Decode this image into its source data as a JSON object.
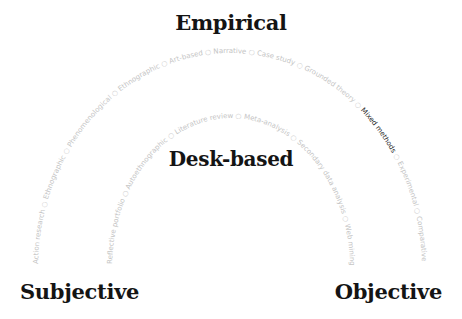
{
  "axes": {
    "top": "Empirical",
    "middle": "Desk-based",
    "left": "Subjective",
    "right": "Objective"
  },
  "separator": "○",
  "outer_arc": {
    "label": "Empirical methods",
    "items": [
      {
        "label": "Action research",
        "highlighted": false
      },
      {
        "label": "Ethnographic",
        "highlighted": false
      },
      {
        "label": "Phenomenological",
        "highlighted": false
      },
      {
        "label": "Ethnographic",
        "highlighted": false
      },
      {
        "label": "Art-based",
        "highlighted": false
      },
      {
        "label": "Narrative",
        "highlighted": false
      },
      {
        "label": "Case study",
        "highlighted": false
      },
      {
        "label": "Grounded theory",
        "highlighted": false
      },
      {
        "label": "Mixed methods",
        "highlighted": true
      },
      {
        "label": "Experimental",
        "highlighted": false
      },
      {
        "label": "Comparative",
        "highlighted": false
      }
    ]
  },
  "inner_arc": {
    "label": "Desk-based methods",
    "items": [
      {
        "label": "Reflective portfolio",
        "highlighted": false
      },
      {
        "label": "Autoethnographic",
        "highlighted": false
      },
      {
        "label": "Literature review",
        "highlighted": false
      },
      {
        "label": "Meta-analysis",
        "highlighted": false
      },
      {
        "label": "Secondary data analysis",
        "highlighted": false
      },
      {
        "label": "Web mining",
        "highlighted": false
      }
    ]
  },
  "colors": {
    "title": "#141414",
    "arc_text": "#c4c4c4",
    "highlight": "#2a2a2a"
  }
}
